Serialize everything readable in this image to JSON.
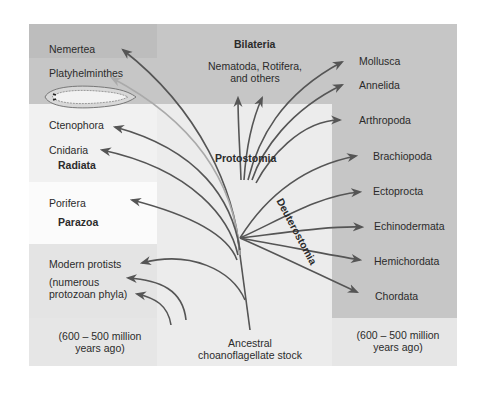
{
  "diagram": {
    "title_groups": {
      "bilateria": "Bilateria",
      "protostomia": "Protostomia",
      "deuterostomia": "Deuterostomia",
      "radiata": "Radiata",
      "parazoa": "Parazoa"
    },
    "left_taxa": [
      "Nemertea",
      "Platyhelminthes",
      "Ctenophora",
      "Cnidaria",
      "Porifera",
      "Modern protists"
    ],
    "protist_note_line1": "(numerous",
    "protist_note_line2": "protozoan phyla)",
    "top_center_line1": "Nematoda, Rotifera,",
    "top_center_line2": "and others",
    "right_taxa": [
      "Mollusca",
      "Annelida",
      "Arthropoda",
      "Brachiopoda",
      "Ectoprocta",
      "Echinodermata",
      "Hemichordata",
      "Chordata"
    ],
    "time_left_line1": "(600 – 500 million",
    "time_left_line2": "years ago)",
    "time_right_line1": "(600 – 500 million",
    "time_right_line2": "years ago)",
    "root_line1": "Ancestral",
    "root_line2": "choanoflagellate stock",
    "colors": {
      "bilateria_bg": "#c4c4c4",
      "inner_light_bg": "#ececec",
      "outer_bg": "#e4e4e4",
      "white_panel": "#fafafa",
      "protist_band": "#e0e0e0",
      "bottom_band": "#dcdcdc",
      "line": "#555555"
    }
  }
}
